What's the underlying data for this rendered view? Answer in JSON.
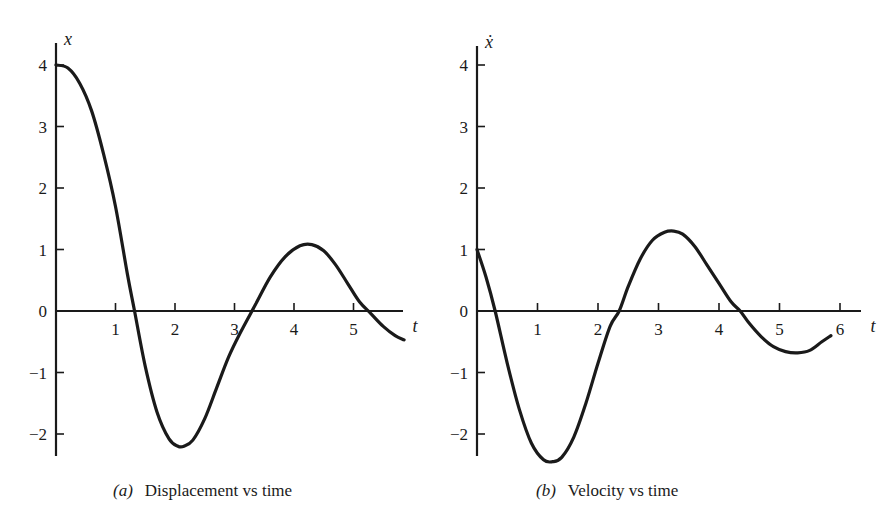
{
  "chart_data": [
    {
      "id": "a",
      "type": "line",
      "title": "Displacement vs time",
      "caption_label": "(a)",
      "xlabel": "t",
      "ylabel": "x",
      "xlim": [
        0,
        5.9
      ],
      "ylim": [
        -2.4,
        4.3
      ],
      "xticks": [
        1,
        2,
        3,
        4,
        5
      ],
      "xtick_labels": [
        "1",
        "2",
        "3",
        "4",
        "5"
      ],
      "yticks": [
        4,
        3,
        2,
        1,
        0,
        -1,
        -2
      ],
      "ytick_labels": [
        "4",
        "3",
        "2",
        "1",
        "0",
        "−1",
        "−2"
      ],
      "grid": false,
      "series": [
        {
          "name": "x(t)",
          "x": [
            0,
            0.2,
            0.4,
            0.6,
            0.8,
            1.0,
            1.2,
            1.32,
            1.5,
            1.7,
            1.9,
            2.05,
            2.15,
            2.3,
            2.5,
            2.7,
            2.9,
            3.1,
            3.35,
            3.6,
            3.85,
            4.1,
            4.3,
            4.5,
            4.7,
            4.9,
            5.1,
            5.3,
            5.5,
            5.7,
            5.85
          ],
          "y": [
            4.0,
            3.95,
            3.7,
            3.25,
            2.55,
            1.7,
            0.6,
            0.0,
            -0.9,
            -1.65,
            -2.08,
            -2.2,
            -2.2,
            -2.1,
            -1.75,
            -1.25,
            -0.75,
            -0.35,
            0.1,
            0.55,
            0.88,
            1.06,
            1.08,
            0.98,
            0.75,
            0.45,
            0.15,
            -0.05,
            -0.25,
            -0.4,
            -0.47
          ]
        }
      ]
    },
    {
      "id": "b",
      "type": "line",
      "title": "Velocity vs time",
      "caption_label": "(b)",
      "xlabel": "t",
      "ylabel": "ẋ",
      "xlim": [
        0,
        6.3
      ],
      "ylim": [
        -2.5,
        4.3
      ],
      "xticks": [
        1,
        2,
        3,
        4,
        5,
        6
      ],
      "xtick_labels": [
        "1",
        "2",
        "3",
        "4",
        "5",
        "6"
      ],
      "yticks": [
        4,
        3,
        2,
        1,
        0,
        -1,
        -2
      ],
      "ytick_labels": [
        "4",
        "3",
        "2",
        "1",
        "0",
        "−1",
        "−2"
      ],
      "grid": false,
      "series": [
        {
          "name": "xdot(t)",
          "x": [
            0,
            0.15,
            0.3,
            0.5,
            0.7,
            0.9,
            1.1,
            1.25,
            1.4,
            1.6,
            1.8,
            2.0,
            2.2,
            2.35,
            2.5,
            2.7,
            2.9,
            3.1,
            3.25,
            3.4,
            3.6,
            3.8,
            4.0,
            4.2,
            4.35,
            4.5,
            4.7,
            4.9,
            5.1,
            5.3,
            5.5,
            5.7,
            5.85
          ],
          "y": [
            1.0,
            0.55,
            0.0,
            -0.85,
            -1.6,
            -2.15,
            -2.42,
            -2.45,
            -2.38,
            -2.05,
            -1.5,
            -0.85,
            -0.25,
            0.0,
            0.4,
            0.85,
            1.15,
            1.28,
            1.3,
            1.25,
            1.05,
            0.75,
            0.45,
            0.15,
            0.0,
            -0.2,
            -0.42,
            -0.58,
            -0.66,
            -0.68,
            -0.64,
            -0.5,
            -0.4
          ]
        }
      ]
    }
  ],
  "captions": {
    "a": {
      "label": "(a)",
      "text": "Displacement vs time"
    },
    "b": {
      "label": "(b)",
      "text": "Velocity vs time"
    }
  },
  "layout": {
    "a": {
      "origin_x": 56,
      "origin_y": 311,
      "px_per_t": 59.5,
      "px_per_unit": 61.5,
      "axis_top": 43,
      "axis_bottom": 456,
      "axis_right": 403
    },
    "b": {
      "origin_x": 477,
      "origin_y": 311,
      "px_per_t": 60.5,
      "px_per_unit": 61.5,
      "axis_top": 46,
      "axis_bottom": 456,
      "axis_right": 861
    }
  },
  "colors": {
    "ink": "#1a1a1a",
    "background": "#ffffff"
  }
}
